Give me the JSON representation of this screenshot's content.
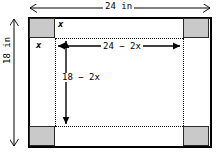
{
  "figure": {
    "colors": {
      "sheet_border": "#000000",
      "corner_fill": "#c9c9c9",
      "corner_border": "#2b2b2b",
      "dimension_line": "#000000",
      "fold_line": "#000000",
      "background": "#ffffff"
    }
  },
  "labels": {
    "overall_width": "24 in",
    "overall_height": "18 in",
    "base_width": "24 − 2x",
    "base_height": "18 − 2x",
    "corner_side_top": "x",
    "corner_side_left": "x"
  },
  "geometry": {
    "sheet_width_in": 24,
    "sheet_height_in": 18,
    "cut_square_side": "x",
    "base_width_expr": "24 - 2x",
    "base_height_expr": "18 - 2x",
    "corner_count": 4
  },
  "icons": {
    "arrow_left": "arrow-left-icon",
    "arrow_right": "arrow-right-icon",
    "arrow_up": "arrow-up-icon",
    "arrow_down": "arrow-down-icon"
  }
}
